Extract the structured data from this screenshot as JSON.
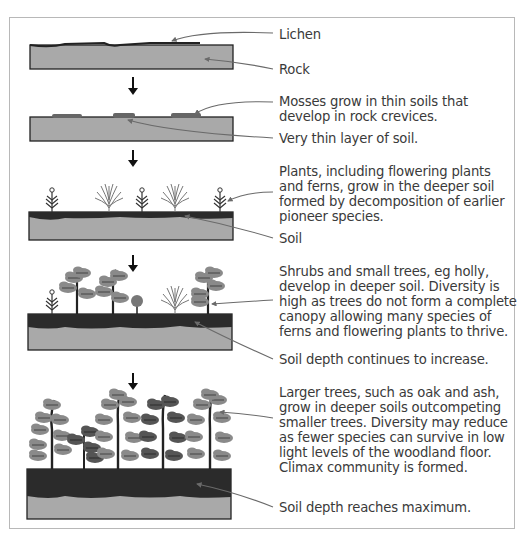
{
  "diagram": {
    "type": "ecological-succession",
    "colors": {
      "rock": "#a9a9a9",
      "soil": "#2b2b2b",
      "outline": "#222222",
      "label_text": "#3a3a3a",
      "pointer_line": "#6a6a6a",
      "foliage_light": "#8a8a8a",
      "foliage_dark": "#555555",
      "frame_border": "#b8b8b8"
    },
    "stages": [
      {
        "id": 1,
        "labels": [
          {
            "name": "lichen-label",
            "text": "Lichen"
          },
          {
            "name": "rock-label",
            "text": "Rock"
          }
        ]
      },
      {
        "id": 2,
        "labels": [
          {
            "name": "mosses-label",
            "lines": [
              "Mosses grow in thin soils that",
              "develop in rock crevices."
            ]
          },
          {
            "name": "thin-soil-label",
            "text": "Very thin layer of soil."
          }
        ]
      },
      {
        "id": 3,
        "labels": [
          {
            "name": "plants-label",
            "lines": [
              "Plants, including flowering plants",
              "and ferns, grow in the deeper soil",
              "formed by decomposition of earlier",
              "pioneer species."
            ]
          },
          {
            "name": "soil-label",
            "text": "Soil"
          }
        ]
      },
      {
        "id": 4,
        "labels": [
          {
            "name": "shrubs-label",
            "lines": [
              "Shrubs and small trees, eg holly,",
              "develop in deeper soil. Diversity is",
              "high as trees do not form a complete",
              "canopy allowing many species of",
              "ferns and flowering plants to thrive."
            ]
          },
          {
            "name": "soil-depth-increase-label",
            "text": "Soil depth continues to increase."
          }
        ]
      },
      {
        "id": 5,
        "labels": [
          {
            "name": "larger-trees-label",
            "lines": [
              "Larger trees, such as oak and ash,",
              "grow in deeper soils outcompeting",
              "smaller trees. Diversity may reduce",
              "as fewer species can survive in low",
              "light levels of the woodland floor.",
              "Climax community is formed."
            ]
          },
          {
            "name": "soil-depth-max-label",
            "text": "Soil depth reaches maximum."
          }
        ]
      }
    ],
    "arrow_icon": "down-arrow-icon"
  }
}
